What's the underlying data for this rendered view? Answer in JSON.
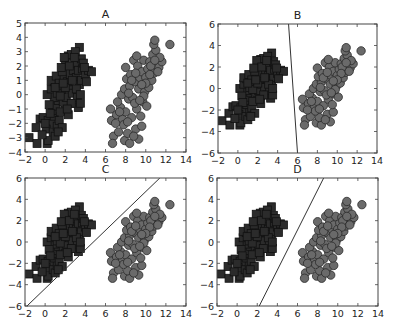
{
  "figure": {
    "width": 394,
    "height": 329,
    "background": "#ffffff"
  },
  "style": {
    "square_fill": "#2b2b2b",
    "square_edge": "#111111",
    "circle_fill": "#6a6a6a",
    "circle_edge": "#2a2a2a",
    "line_color": "#333333",
    "frame_color": "#444444"
  },
  "chart_data": [
    {
      "type": "scatter",
      "title": "A",
      "frame": {
        "x0": 25,
        "y0": 23,
        "x1": 186,
        "y1": 152
      },
      "xlim": [
        -2,
        14
      ],
      "ylim": [
        -4,
        5
      ],
      "xticks": [
        -2,
        0,
        2,
        4,
        6,
        8,
        10,
        12,
        14
      ],
      "yticks": [
        -4,
        -3,
        -2,
        -1,
        0,
        1,
        2,
        3,
        4,
        5
      ],
      "xlabel": "",
      "ylabel": "",
      "grid": false,
      "series": [
        {
          "name": "class 1",
          "marker": "square"
        },
        {
          "name": "class 2",
          "marker": "circle"
        }
      ],
      "decision_line": null
    },
    {
      "type": "scatter",
      "title": "B",
      "frame": {
        "x0": 218,
        "y0": 24,
        "x1": 377,
        "y1": 153
      },
      "xlim": [
        -2,
        14
      ],
      "ylim": [
        -6,
        6
      ],
      "xticks": [
        -2,
        0,
        2,
        4,
        6,
        8,
        10,
        12,
        14
      ],
      "yticks": [
        -6,
        -4,
        -2,
        0,
        2,
        4,
        6
      ],
      "xlabel": "",
      "ylabel": "",
      "grid": false,
      "series": [
        {
          "name": "class 1",
          "marker": "square"
        },
        {
          "name": "class 2",
          "marker": "circle"
        }
      ],
      "decision_line": {
        "x_at_ymin": 6.0,
        "x_at_ymax": 5.1
      }
    },
    {
      "type": "scatter",
      "title": "C",
      "frame": {
        "x0": 25,
        "y0": 178,
        "x1": 186,
        "y1": 306
      },
      "xlim": [
        -2,
        14
      ],
      "ylim": [
        -6,
        6
      ],
      "xticks": [
        -2,
        0,
        2,
        4,
        6,
        8,
        10,
        12,
        14
      ],
      "yticks": [
        -6,
        -4,
        -2,
        0,
        2,
        4,
        6
      ],
      "xlabel": "",
      "ylabel": "",
      "grid": false,
      "series": [
        {
          "name": "class 1",
          "marker": "square"
        },
        {
          "name": "class 2",
          "marker": "circle"
        }
      ],
      "decision_line": {
        "x_at_ymin": -1.8,
        "x_at_ymax": 11.4
      }
    },
    {
      "type": "scatter",
      "title": "D",
      "frame": {
        "x0": 217,
        "y0": 178,
        "x1": 378,
        "y1": 306
      },
      "xlim": [
        -2,
        14
      ],
      "ylim": [
        -6,
        6
      ],
      "xticks": [
        -2,
        0,
        2,
        4,
        6,
        8,
        10,
        12,
        14
      ],
      "yticks": [
        -6,
        -4,
        -2,
        0,
        2,
        4,
        6
      ],
      "xlabel": "",
      "ylabel": "",
      "grid": false,
      "series": [
        {
          "name": "class 1",
          "marker": "square"
        },
        {
          "name": "class 2",
          "marker": "circle"
        }
      ],
      "decision_line": {
        "x_at_ymin": 2.2,
        "x_at_ymax": 8.6
      }
    }
  ],
  "points": {
    "squares": [
      [
        -1.6,
        -3.0
      ],
      [
        -0.8,
        -3.4
      ],
      [
        0.2,
        -3.4
      ],
      [
        0.3,
        -3.2
      ],
      [
        -0.9,
        -2.3
      ],
      [
        -0.5,
        -1.7
      ],
      [
        -0.2,
        -1.6
      ],
      [
        0.3,
        -1.8
      ],
      [
        0.6,
        -2.0
      ],
      [
        0.1,
        -2.4
      ],
      [
        0.8,
        -2.6
      ],
      [
        1.0,
        -2.9
      ],
      [
        1.2,
        -2.2
      ],
      [
        0.9,
        -1.5
      ],
      [
        1.4,
        -1.8
      ],
      [
        1.7,
        -2.3
      ],
      [
        0.7,
        -1.1
      ],
      [
        1.1,
        -0.8
      ],
      [
        1.3,
        -0.4
      ],
      [
        0.9,
        -0.2
      ],
      [
        0.2,
        0.0
      ],
      [
        0.6,
        0.4
      ],
      [
        0.9,
        0.9
      ],
      [
        0.6,
        1.0
      ],
      [
        1.1,
        1.3
      ],
      [
        1.4,
        0.8
      ],
      [
        1.6,
        0.2
      ],
      [
        1.8,
        -0.5
      ],
      [
        2.0,
        -1.1
      ],
      [
        2.3,
        -1.4
      ],
      [
        1.5,
        -1.2
      ],
      [
        2.1,
        -0.2
      ],
      [
        2.4,
        0.4
      ],
      [
        2.7,
        0.1
      ],
      [
        2.9,
        -0.6
      ],
      [
        3.3,
        -0.9
      ],
      [
        3.2,
        -0.2
      ],
      [
        3.5,
        -0.6
      ],
      [
        1.9,
        1.1
      ],
      [
        2.2,
        0.9
      ],
      [
        2.5,
        1.4
      ],
      [
        2.8,
        1.7
      ],
      [
        3.1,
        1.2
      ],
      [
        3.4,
        0.7
      ],
      [
        3.6,
        1.0
      ],
      [
        1.7,
        1.6
      ],
      [
        2.0,
        2.2
      ],
      [
        2.3,
        2.7
      ],
      [
        2.6,
        2.8
      ],
      [
        1.9,
        2.6
      ],
      [
        3.0,
        2.2
      ],
      [
        3.3,
        1.7
      ],
      [
        3.7,
        1.8
      ],
      [
        4.0,
        1.4
      ],
      [
        4.3,
        1.7
      ],
      [
        4.6,
        1.6
      ],
      [
        3.6,
        2.5
      ],
      [
        3.4,
        3.3
      ],
      [
        3.0,
        3.0
      ],
      [
        2.4,
        2.0
      ],
      [
        1.2,
        0.1
      ],
      [
        1.5,
        -0.1
      ],
      [
        2.6,
        -0.6
      ],
      [
        3.1,
        0.4
      ],
      [
        2.0,
        0.5
      ],
      [
        0.4,
        -0.7
      ],
      [
        1.6,
        1.9
      ],
      [
        2.9,
        2.6
      ],
      [
        3.8,
        2.2
      ],
      [
        1.0,
        0.5
      ],
      [
        0.5,
        -1.3
      ],
      [
        2.2,
        -1.0
      ],
      [
        1.3,
        -2.6
      ],
      [
        0.0,
        -2.0
      ],
      [
        -0.3,
        -2.8
      ],
      [
        1.8,
        0.8
      ],
      [
        2.7,
        1.0
      ],
      [
        3.5,
        0.0
      ],
      [
        4.1,
        0.9
      ],
      [
        3.9,
        1.9
      ]
    ],
    "circles": [
      [
        6.5,
        -1.0
      ],
      [
        6.6,
        -1.8
      ],
      [
        6.8,
        -2.9
      ],
      [
        6.7,
        -3.4
      ],
      [
        7.3,
        -2.6
      ],
      [
        7.1,
        -1.4
      ],
      [
        7.5,
        -0.9
      ],
      [
        7.2,
        -0.5
      ],
      [
        7.7,
        -1.7
      ],
      [
        7.9,
        -3.2
      ],
      [
        8.4,
        -3.4
      ],
      [
        8.2,
        -2.7
      ],
      [
        7.8,
        -2.1
      ],
      [
        8.0,
        -1.2
      ],
      [
        7.6,
        0.0
      ],
      [
        7.9,
        0.4
      ],
      [
        8.3,
        -0.3
      ],
      [
        8.6,
        -1.6
      ],
      [
        9.0,
        -2.4
      ],
      [
        9.3,
        -3.1
      ],
      [
        9.6,
        -2.2
      ],
      [
        9.1,
        -1.0
      ],
      [
        8.7,
        -0.2
      ],
      [
        8.4,
        0.6
      ],
      [
        8.1,
        1.1
      ],
      [
        8.0,
        1.9
      ],
      [
        8.5,
        1.4
      ],
      [
        8.9,
        0.9
      ],
      [
        9.3,
        0.4
      ],
      [
        9.7,
        -0.5
      ],
      [
        9.5,
        -1.5
      ],
      [
        10.1,
        -0.8
      ],
      [
        9.9,
        0.2
      ],
      [
        9.4,
        1.2
      ],
      [
        8.8,
        2.4
      ],
      [
        9.2,
        2.0
      ],
      [
        9.6,
        1.6
      ],
      [
        10.0,
        1.2
      ],
      [
        10.3,
        0.5
      ],
      [
        10.6,
        1.0
      ],
      [
        10.2,
        1.8
      ],
      [
        9.8,
        2.4
      ],
      [
        10.4,
        2.3
      ],
      [
        10.8,
        1.5
      ],
      [
        11.0,
        2.1
      ],
      [
        11.3,
        1.9
      ],
      [
        11.6,
        2.3
      ],
      [
        10.7,
        2.8
      ],
      [
        11.0,
        3.1
      ],
      [
        10.8,
        3.5
      ],
      [
        10.9,
        3.8
      ],
      [
        12.4,
        3.5
      ],
      [
        11.4,
        2.6
      ],
      [
        10.5,
        2.0
      ],
      [
        9.1,
        2.7
      ],
      [
        8.6,
        1.0
      ],
      [
        8.9,
        -0.6
      ],
      [
        9.8,
        -0.1
      ],
      [
        10.4,
        1.4
      ],
      [
        9.0,
        1.5
      ],
      [
        8.2,
        -1.9
      ],
      [
        8.8,
        -2.9
      ],
      [
        7.4,
        -1.2
      ],
      [
        9.4,
        -0.4
      ],
      [
        10.0,
        0.8
      ],
      [
        8.3,
        0.1
      ],
      [
        9.6,
        0.7
      ],
      [
        10.9,
        2.4
      ],
      [
        11.2,
        1.6
      ],
      [
        7.0,
        -2.0
      ]
    ]
  }
}
